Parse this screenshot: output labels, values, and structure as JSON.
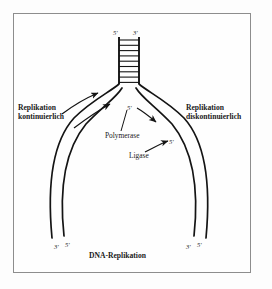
{
  "figure": {
    "title": "DNA-Replikation",
    "type": "dna-replication-fork-diagram",
    "frame": {
      "border_color": "#8d8d8d",
      "background": "#fefefe"
    },
    "stroke_color": "#141414",
    "labels": {
      "left_strand": {
        "line1": "Replikation",
        "line2": "kontinuierlich"
      },
      "right_strand": {
        "line1": "Replikation",
        "line2": "diskontinuierlich"
      },
      "enzyme_polymerase": "Polymerase",
      "enzyme_ligase": "Ligase",
      "caption": "DNA-Replikation"
    },
    "end_markers": {
      "parent_duplex_left": "5'",
      "parent_duplex_right": "3'",
      "fork_nascent": "5'",
      "ligase_target": "5'",
      "daughter_left_inner": "3'",
      "daughter_left_outer": "5'",
      "daughter_right_inner": "3'",
      "daughter_right_outer": "5'"
    },
    "ladder": {
      "rung_count": 10,
      "description": "parental double helix drawn as ladder rungs"
    },
    "arrows": [
      {
        "name": "leading-strand-outer-arrow",
        "direction": "up-right"
      },
      {
        "name": "leading-strand-inner-arrow",
        "direction": "up-right"
      },
      {
        "name": "polymerase-arrow",
        "direction": "down-right"
      },
      {
        "name": "ligase-arrow",
        "direction": "up-right"
      }
    ]
  }
}
